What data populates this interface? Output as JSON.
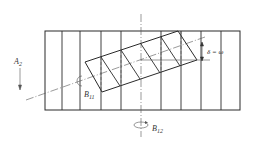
{
  "diagram": {
    "colors": {
      "stroke": "#2a2a2a",
      "thin": "#555555",
      "background": "#ffffff"
    },
    "labels": {
      "a2": {
        "main": "A",
        "sub": "2"
      },
      "b11": {
        "main": "B",
        "sub": "11"
      },
      "b12": {
        "main": "B",
        "sub": "12"
      },
      "delta": "δ = ω"
    },
    "outer_rect": {
      "x": 45,
      "y": 31,
      "width": 195,
      "height": 79
    },
    "vertical_lines_x": [
      62,
      80,
      101,
      121,
      141,
      161,
      181,
      201,
      221
    ]
  }
}
